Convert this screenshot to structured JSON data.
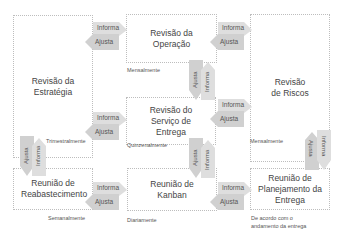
{
  "diagram": {
    "boxes": {
      "estrategia": "Revisão da Estratégia",
      "operacao": "Revisão da Operação",
      "riscos": "Revisão de Riscos",
      "servico": "Revisão do Serviço de Entrega",
      "reabastecimento": "Reunião de Reabastecimento",
      "kanban": "Reunião de Kanban",
      "planejamento": "Reunião de Planejamento da Entrega"
    },
    "frequencies": {
      "estrategia": "Trimestralmente",
      "operacao": "Mensalmente",
      "riscos": "Mensalmente",
      "servico": "Quinzenalmente",
      "reabastecimento": "Semanalmente",
      "kanban": "Diariamente",
      "planejamento_line1": "De acordo com o",
      "planejamento_line2": "andamento da entrega"
    },
    "arrow_labels": {
      "informa": "Informa",
      "ajusta": "Ajusta"
    },
    "colors": {
      "arrow_fill": "#d9d9d9",
      "box_border": "#bdbdbd"
    }
  }
}
